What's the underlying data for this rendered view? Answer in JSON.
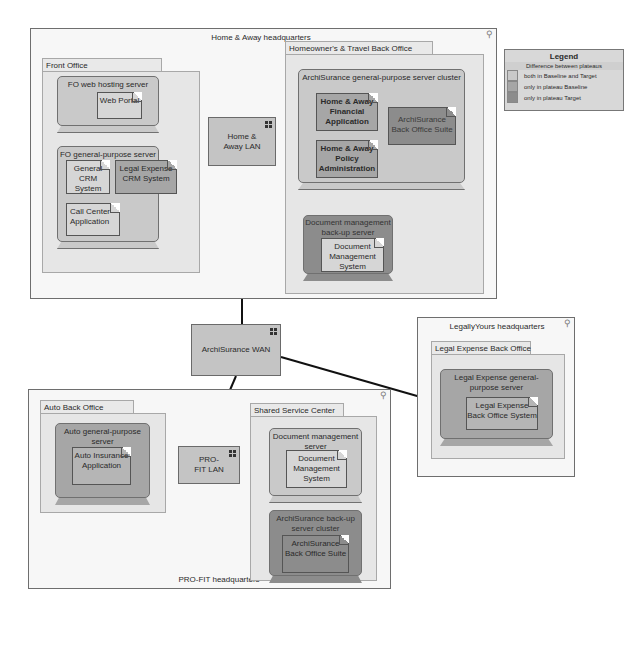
{
  "colors": {
    "both": "#c9c9c9",
    "baseline": "#a6a6a6",
    "target": "#8c8c8c",
    "location_bg": "#f7f7f7",
    "line": "#111111"
  },
  "locations": {
    "home_away": {
      "title": "Home & Away headquarters",
      "front_office": {
        "label": "Front Office",
        "web_server": {
          "label": "FO web hosting server",
          "artifact": "Web Portal"
        },
        "general_server": {
          "label": "FO general-purpose server",
          "artifacts": [
            "General CRM System",
            "Legal Expense CRM System",
            "Call Center Application"
          ]
        }
      },
      "lan": {
        "label": "Home & Away LAN"
      },
      "back_office": {
        "label": "Homeowner's & Travel Back Office",
        "cluster": {
          "label": "ArchiSurance general-purpose server cluster",
          "artifacts": [
            "Home & Away Financial Application",
            "ArchiSurance Back Office Suite",
            "Home & Away Policy Administration"
          ]
        },
        "backup_server": {
          "label": "Document management back-up server",
          "artifact": "Document Management System"
        }
      }
    },
    "wan": {
      "label": "ArchiSurance WAN"
    },
    "legallyyours": {
      "title": "LegallyYours headquarters",
      "back_office": {
        "label": "Legal Expense Back Office",
        "server": {
          "label": "Legal Expense general-purpose server",
          "artifact": "Legal Expense Back Office System"
        }
      }
    },
    "profit": {
      "title": "PRO-FIT headquarters",
      "auto_office": {
        "label": "Auto Back Office",
        "server": {
          "label": "Auto general-purpose server",
          "artifact": "Auto Insurance Application"
        }
      },
      "lan": {
        "label": "PRO-FIT LAN"
      },
      "shared": {
        "label": "Shared Service Center",
        "doc_server": {
          "label": "Document management server",
          "artifact": "Document Management System"
        },
        "backup_cluster": {
          "label": "ArchiSurance back-up server cluster",
          "artifact": "ArchiSurance Back Office Suite"
        }
      }
    }
  },
  "legend": {
    "title": "Legend",
    "subtitle": "Difference between plateaus",
    "items": [
      {
        "label": "both in Baseline and Target",
        "color": "#c9c9c9"
      },
      {
        "label": "only in plateau Baseline",
        "color": "#a6a6a6"
      },
      {
        "label": "only in plateau Target",
        "color": "#8c8c8c"
      }
    ]
  }
}
